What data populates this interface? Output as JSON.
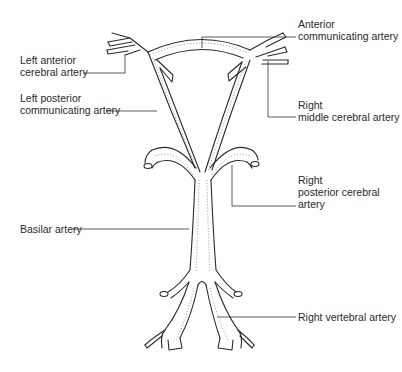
{
  "diagram": {
    "labels": {
      "left_anterior_cerebral": {
        "line1": "Left anterior",
        "line2": "cerebral artery"
      },
      "left_posterior_communicating": {
        "line1": "Left posterior",
        "line2": "communicating artery"
      },
      "basilar": {
        "line1": "Basilar artery"
      },
      "anterior_communicating": {
        "line1": "Anterior",
        "line2": "communicating artery"
      },
      "right_middle_cerebral": {
        "line1": "Right",
        "line2": "middle cerebral artery"
      },
      "right_posterior_cerebral": {
        "line1": "Right",
        "line2": "posterior cerebral",
        "line3": "artery"
      },
      "right_vertebral": {
        "line1": "Right vertebral artery"
      }
    },
    "colors": {
      "line": "#2a2a2a",
      "background": "#ffffff"
    }
  }
}
